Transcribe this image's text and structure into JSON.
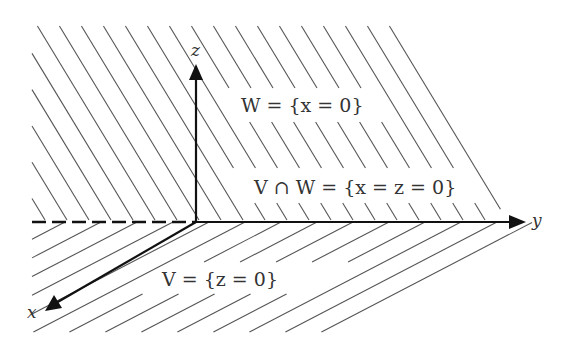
{
  "diagram": {
    "axes": [
      {
        "name": "x-axis",
        "label": "x"
      },
      {
        "name": "y-axis",
        "label": "y"
      },
      {
        "name": "z-axis",
        "label": "z"
      }
    ],
    "labels": {
      "w_plane": "W = {x = 0}",
      "intersection": "V ∩ W = {x = z = 0}",
      "v_plane": "V = {z = 0}"
    },
    "colors": {
      "axis": "#111111",
      "hatch": "#555555",
      "text": "#333333",
      "background": "#ffffff"
    }
  }
}
